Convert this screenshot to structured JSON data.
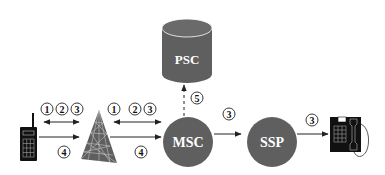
{
  "diagram": {
    "type": "mobile-call-flow",
    "colors": {
      "node_fill": "#5f5f5f",
      "node_dark": "#4a4a4a",
      "tower_lines": "#cfcfcf",
      "device_fill": "#111111",
      "arrow": "#222222",
      "background": "#ffffff"
    },
    "nodes": {
      "psc": {
        "label": "PSC",
        "shape": "cylinder"
      },
      "msc": {
        "label": "MSC",
        "shape": "circle"
      },
      "ssp": {
        "label": "SSP",
        "shape": "circle"
      },
      "handset": {
        "label": "",
        "icon": "mobile-handset-icon"
      },
      "tower": {
        "label": "",
        "icon": "base-station-tower-icon"
      },
      "phone": {
        "label": "",
        "icon": "desk-telephone-icon"
      }
    },
    "steps": {
      "handset_tower_top": [
        "1",
        "2",
        "3"
      ],
      "handset_tower_bottom": "4",
      "tower_msc_top": [
        "1",
        "2",
        "3"
      ],
      "tower_msc_bottom": "4",
      "msc_psc": "5",
      "msc_ssp": "3",
      "ssp_phone": "3"
    },
    "edges": [
      {
        "from": "handset",
        "to": "tower",
        "style": "bidirectional",
        "steps": [
          "1",
          "2",
          "3"
        ]
      },
      {
        "from": "handset",
        "to": "tower",
        "style": "directed",
        "steps": [
          "4"
        ]
      },
      {
        "from": "tower",
        "to": "msc",
        "style": "bidirectional",
        "steps": [
          "1",
          "2",
          "3"
        ]
      },
      {
        "from": "tower",
        "to": "msc",
        "style": "directed",
        "steps": [
          "4"
        ]
      },
      {
        "from": "msc",
        "to": "psc",
        "style": "dashed-directed",
        "steps": [
          "5"
        ]
      },
      {
        "from": "msc",
        "to": "ssp",
        "style": "directed",
        "steps": [
          "3"
        ]
      },
      {
        "from": "ssp",
        "to": "phone",
        "style": "directed",
        "steps": [
          "3"
        ]
      }
    ]
  }
}
